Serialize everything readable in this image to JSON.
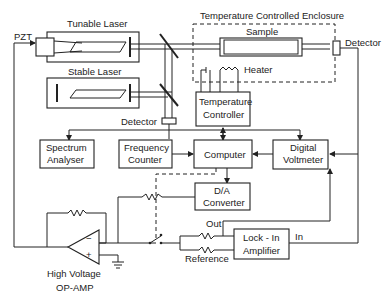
{
  "diagram": {
    "labels": {
      "pzt": "PZT",
      "tunable_laser": "Tunable Laser",
      "stable_laser": "Stable Laser",
      "enclosure": "Temperature Controlled Enclosure",
      "sample": "Sample",
      "heater": "Heater",
      "detector_right": "Detector",
      "detector_mid": "Detector",
      "temp_controller_1": "Temperature",
      "temp_controller_2": "Controller",
      "spectrum_1": "Spectrum",
      "spectrum_2": "Analyser",
      "freq_1": "Frequency",
      "freq_2": "Counter",
      "computer": "Computer",
      "dvm_1": "Digital",
      "dvm_2": "Voltmeter",
      "da_1": "D/A",
      "da_2": "Converter",
      "out": "Out",
      "in": "In",
      "reference": "Reference",
      "lockin_1": "Lock - In",
      "lockin_2": "Amplifier",
      "opamp_1": "High Voltage",
      "opamp_2": "OP-AMP",
      "minus": "−",
      "plus": "+"
    }
  }
}
